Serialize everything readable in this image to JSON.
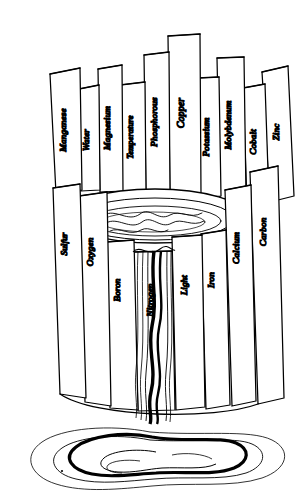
{
  "figure": {
    "subtitle": "Law of the Minimum",
    "background_color": "#ffffff",
    "ink_color": "#000000",
    "style": "hand-drawn line illustration"
  },
  "barrel": {
    "name": "barrel",
    "rim_label": "barrel rim",
    "interior_label": "barrel interior",
    "limiting_stave": "Nitrogen",
    "tallest_stave": "Copper",
    "stave_count": 17
  },
  "staves": [
    {
      "label": "Sulfur",
      "position": "far-left",
      "height": "medium"
    },
    {
      "label": "Manganese",
      "position": "back-left",
      "height": "tall"
    },
    {
      "label": "Oxygen",
      "position": "front-left",
      "height": "medium"
    },
    {
      "label": "Water",
      "position": "back-left",
      "height": "medium"
    },
    {
      "label": "Magnesium",
      "position": "back-left",
      "height": "tall"
    },
    {
      "label": "Boron",
      "position": "front-left",
      "height": "short"
    },
    {
      "label": "Temperature",
      "position": "back-center-left",
      "height": "medium"
    },
    {
      "label": "Phosphorous",
      "position": "back-center",
      "height": "tall"
    },
    {
      "label": "Nitrogen",
      "position": "front-center",
      "height": "shortest"
    },
    {
      "label": "Copper",
      "position": "back-center",
      "height": "tallest"
    },
    {
      "label": "Light",
      "position": "front-center",
      "height": "short"
    },
    {
      "label": "Potassium",
      "position": "back-center-right",
      "height": "tall"
    },
    {
      "label": "Iron",
      "position": "front-right",
      "height": "short"
    },
    {
      "label": "Molybdenum",
      "position": "back-right",
      "height": "tall"
    },
    {
      "label": "Calcium",
      "position": "front-right",
      "height": "medium"
    },
    {
      "label": "Cobalt",
      "position": "back-right",
      "height": "medium"
    },
    {
      "label": "Zinc",
      "position": "far-right-back",
      "height": "tall"
    },
    {
      "label": "Carbon",
      "position": "far-right-front",
      "height": "medium"
    }
  ],
  "water": {
    "stream_label": "water overflow stream",
    "puddle_label": "spilled water puddle",
    "overflow_over": "Nitrogen"
  }
}
